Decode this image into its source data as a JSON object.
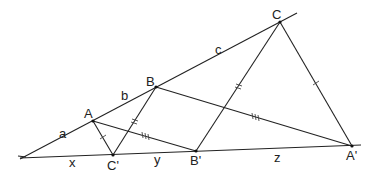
{
  "diagram": {
    "type": "geometry",
    "colors": {
      "stroke": "#222222",
      "background": "#ffffff"
    },
    "points": {
      "O": {
        "x": 22,
        "y": 158
      },
      "A": {
        "x": 93,
        "y": 121,
        "label": "A"
      },
      "B": {
        "x": 156,
        "y": 87,
        "label": "B"
      },
      "C": {
        "x": 280,
        "y": 22,
        "label": "C"
      },
      "Cp": {
        "x": 113,
        "y": 155,
        "label": "C'"
      },
      "Bp": {
        "x": 196,
        "y": 151,
        "label": "B'"
      },
      "Ap": {
        "x": 352,
        "y": 146,
        "label": "A'"
      }
    },
    "labels": {
      "A": "A",
      "B": "B",
      "C": "C",
      "Cp": "C'",
      "Bp": "B'",
      "Ap": "A'",
      "a": "a",
      "b": "b",
      "c": "c",
      "x": "x",
      "y": "y",
      "z": "z"
    },
    "segments": [
      {
        "from": "O",
        "to": "C",
        "name": "upper-ray"
      },
      {
        "from": "O",
        "to": "Ap",
        "name": "lower-ray"
      },
      {
        "from": "A",
        "to": "Cp",
        "ticks": 1
      },
      {
        "from": "Cp",
        "to": "B",
        "ticks": 2
      },
      {
        "from": "A",
        "to": "Bp",
        "ticks": 3
      },
      {
        "from": "B",
        "to": "Ap",
        "ticks": 3
      },
      {
        "from": "Bp",
        "to": "C",
        "ticks": 2
      },
      {
        "from": "C",
        "to": "Ap",
        "ticks": 1
      }
    ]
  }
}
